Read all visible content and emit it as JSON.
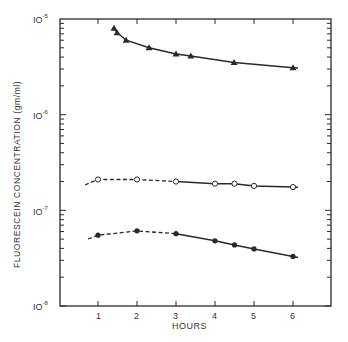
{
  "chart_data": {
    "type": "line",
    "title": "",
    "xlabel": "HOURS",
    "ylabel": "FLUORESCEIN CONCENTRATION (gm/ml)",
    "yscale": "log",
    "xlim": [
      0,
      7
    ],
    "ylim": [
      1e-08,
      1e-05
    ],
    "x_ticks": [
      "1",
      "2",
      "3",
      "4",
      "5",
      "6"
    ],
    "y_ticks": [
      "10^-5",
      "10^-6",
      "10^-7",
      "10^-8"
    ],
    "grid": false,
    "legend": null,
    "series": [
      {
        "name": "Upper curve (filled triangles)",
        "marker": "filled-triangle",
        "dashed_until_x": 1.4,
        "x": [
          1.41,
          1.49,
          1.72,
          2.31,
          3.0,
          3.38,
          4.49,
          6.0
        ],
        "values": [
          8e-06,
          7.2e-06,
          6e-06,
          5e-06,
          4.3e-06,
          4.1e-06,
          3.5e-06,
          3.1e-06
        ]
      },
      {
        "name": "Middle curve (open circles)",
        "marker": "open-circle",
        "dashed_until_x": 3.0,
        "x": [
          1.0,
          2.0,
          3.0,
          4.0,
          4.5,
          5.0,
          6.0
        ],
        "values": [
          2.1e-07,
          2.1e-07,
          2e-07,
          1.9e-07,
          1.9e-07,
          1.8e-07,
          1.75e-07
        ]
      },
      {
        "name": "Lower curve (filled circles)",
        "marker": "filled-circle",
        "dashed_until_x": 3.0,
        "x": [
          1.0,
          2.0,
          3.0,
          4.0,
          4.5,
          5.0,
          6.0
        ],
        "values": [
          5.5e-08,
          6.1e-08,
          5.7e-08,
          4.8e-08,
          4.35e-08,
          3.95e-08,
          3.3e-08
        ]
      }
    ]
  },
  "labels": {
    "ylabel": "FLUORESCEIN  CONCENTRATION  (gm/ml)",
    "xlabel": "HOURS",
    "decades": [
      {
        "base": "IO",
        "exp": "-5"
      },
      {
        "base": "IO",
        "exp": "-6"
      },
      {
        "base": "IO",
        "exp": "-7"
      },
      {
        "base": "IO",
        "exp": "-8"
      }
    ],
    "xticks": [
      "1",
      "2",
      "3",
      "4",
      "5",
      "6"
    ]
  }
}
